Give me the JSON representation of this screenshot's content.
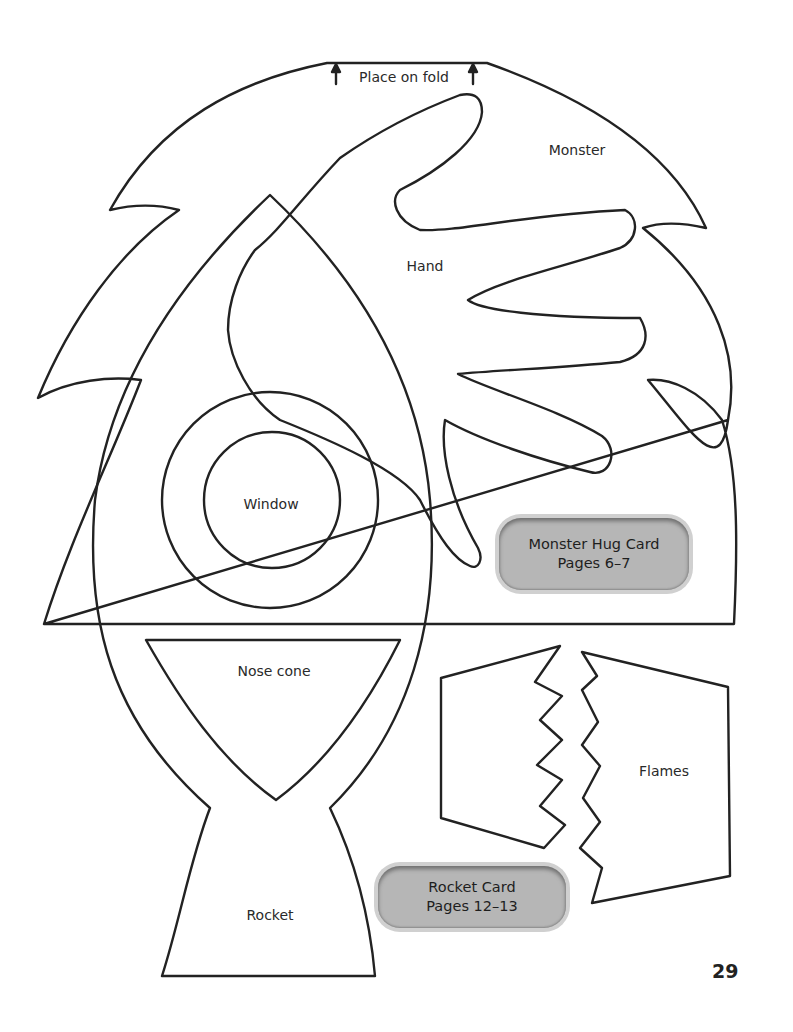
{
  "fold": {
    "label": "Place on fold",
    "arrow_icon": "arrow-up-icon"
  },
  "shapes": {
    "monster": "Monster",
    "hand": "Hand",
    "window": "Window",
    "nose_cone": "Nose cone",
    "flames": "Flames",
    "rocket": "Rocket"
  },
  "badges": [
    {
      "line1": "Monster Hug Card",
      "line2": "Pages 6–7"
    },
    {
      "line1": "Rocket Card",
      "line2": "Pages 12–13"
    }
  ],
  "page_number": "29",
  "colors": {
    "outline": "#222222",
    "badge_fill": "#b6b6b6",
    "badge_rim": "#d0d0d0"
  }
}
